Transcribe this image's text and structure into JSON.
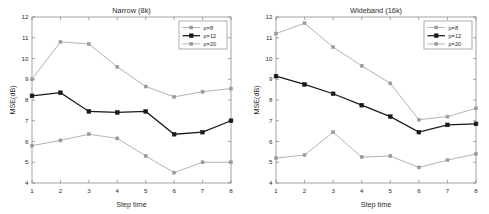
{
  "figure": {
    "background_color": "#ffffff",
    "axis_color": "#8c8c8c",
    "text_color": "#2b2b2b"
  },
  "panels": [
    {
      "id": "narrow",
      "title": "Narrow (8k)",
      "xlabel": "Step time",
      "ylabel": "MSE(dB)"
    },
    {
      "id": "wideband",
      "title": "Wideband (16k)",
      "xlabel": "Step time",
      "ylabel": "MSE(dB)"
    }
  ],
  "legend": {
    "entries": [
      {
        "label": "p=8",
        "color": "#9a9a9a",
        "marker": "square"
      },
      {
        "label": "p=12",
        "color": "#1a1a1a",
        "marker": "square"
      },
      {
        "label": "p=20",
        "color": "#9a9a9a",
        "marker": "square"
      }
    ]
  },
  "axis": {
    "xticks": [
      "1",
      "2",
      "3",
      "4",
      "5",
      "6",
      "7",
      "8"
    ],
    "yticks": [
      "4",
      "5",
      "6",
      "7",
      "8",
      "9",
      "10",
      "11",
      "12"
    ]
  },
  "chart_data": [
    {
      "type": "line",
      "title": "Narrow (8k)",
      "xlabel": "Step time",
      "ylabel": "MSE(dB)",
      "x": [
        1,
        2,
        3,
        4,
        5,
        6,
        7,
        8
      ],
      "xlim": [
        1,
        8
      ],
      "ylim": [
        4,
        12
      ],
      "grid": false,
      "legend_position": "top-right",
      "series": [
        {
          "name": "p=8",
          "values": [
            9.0,
            10.8,
            10.7,
            9.6,
            8.65,
            8.15,
            8.4,
            8.55
          ],
          "color": "#9a9a9a"
        },
        {
          "name": "p=12",
          "values": [
            8.2,
            8.35,
            7.45,
            7.4,
            7.45,
            6.35,
            6.45,
            7.0
          ],
          "color": "#1a1a1a"
        },
        {
          "name": "p=20",
          "values": [
            5.8,
            6.05,
            6.35,
            6.15,
            5.3,
            4.5,
            5.0,
            5.0
          ],
          "color": "#9a9a9a"
        }
      ]
    },
    {
      "type": "line",
      "title": "Wideband (16k)",
      "xlabel": "Step time",
      "ylabel": "MSE(dB)",
      "x": [
        1,
        2,
        3,
        4,
        5,
        6,
        7,
        8
      ],
      "xlim": [
        1,
        8
      ],
      "ylim": [
        4,
        12
      ],
      "grid": false,
      "legend_position": "top-right",
      "series": [
        {
          "name": "p=8",
          "values": [
            11.2,
            11.7,
            10.55,
            9.65,
            8.8,
            7.05,
            7.2,
            7.6
          ],
          "color": "#9a9a9a"
        },
        {
          "name": "p=12",
          "values": [
            9.15,
            8.75,
            8.3,
            7.75,
            7.2,
            6.45,
            6.8,
            6.85
          ],
          "color": "#1a1a1a"
        },
        {
          "name": "p=20",
          "values": [
            5.2,
            5.35,
            6.45,
            5.25,
            5.3,
            4.75,
            5.1,
            5.4
          ],
          "color": "#9a9a9a"
        }
      ]
    }
  ]
}
